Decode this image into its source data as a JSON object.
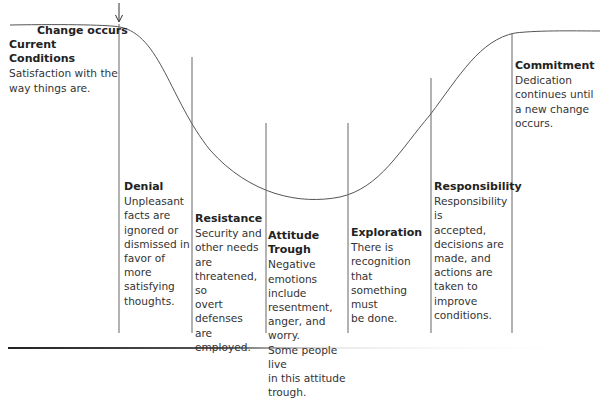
{
  "diagram": {
    "type": "change-response curve",
    "change_marker": {
      "label": "Change occurs",
      "icon": "down-arrow-icon"
    },
    "stages": [
      {
        "title": "Current Conditions",
        "description": "Satisfaction with the way things are.",
        "lines": [
          "Satisfaction with the",
          "way things are."
        ]
      },
      {
        "title": "Denial",
        "description": "Unpleasant facts are ignored or dismissed in favor of more satisfying thoughts.",
        "lines": [
          "Unpleasant",
          "facts are",
          "ignored or",
          "dismissed in",
          "favor of more",
          "satisfying",
          "thoughts."
        ]
      },
      {
        "title": "Resistance",
        "description": "Security and other needs are threatened, so overt defenses are employed.",
        "lines": [
          "Security and",
          "other needs are",
          "threatened, so",
          "overt defenses",
          "are employed."
        ]
      },
      {
        "title": "Attitude Trough",
        "description": "Negative emotions include resentment, anger, and worry. Some people live in this attitude trough.",
        "lines": [
          "Negative",
          "emotions include",
          "resentment,",
          "anger, and worry.",
          "Some people live",
          "in this attitude",
          "trough."
        ]
      },
      {
        "title": "Exploration",
        "description": "There is recognition that something must be done.",
        "lines": [
          "There is",
          "recognition that",
          "something must",
          "be done."
        ]
      },
      {
        "title": "Responsibility",
        "description": "Responsibility is accepted, decisions are made, and actions are taken to improve conditions.",
        "lines": [
          "Responsibility is",
          "accepted,",
          "decisions are",
          "made, and",
          "actions are",
          "taken to",
          "improve",
          "conditions."
        ]
      },
      {
        "title": "Commitment",
        "description": "Dedication continues until a new change occurs.",
        "lines": [
          "Dedication",
          "continues until",
          "a new change",
          "occurs."
        ]
      }
    ],
    "colors": {
      "curve": "#555555",
      "divider": "#666666",
      "text": "#333333",
      "baseline": "#333333"
    }
  }
}
